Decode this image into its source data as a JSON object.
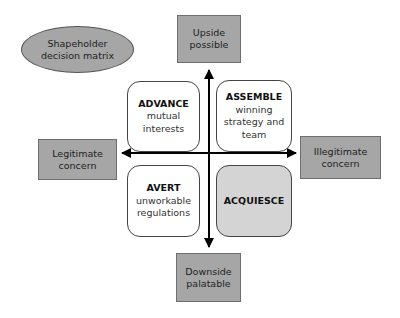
{
  "title_ellipse": {
    "lines": [
      "Shapeholder",
      "decision matrix"
    ]
  },
  "axes": {
    "top": {
      "lines": [
        "Upside",
        "possible"
      ]
    },
    "bottom": {
      "lines": [
        "Downside",
        "palatable"
      ]
    },
    "left": {
      "lines": [
        "Legitimate",
        "concern"
      ]
    },
    "right": {
      "lines": [
        "Illegitimate",
        "concern"
      ]
    }
  },
  "quadrants": [
    {
      "position": "top-left",
      "title": "ADVANCE",
      "lines": [
        "mutual",
        "interests"
      ],
      "shaded": false
    },
    {
      "position": "top-right",
      "title": "ASSEMBLE",
      "lines": [
        "winning",
        "strategy and",
        "team"
      ],
      "shaded": false
    },
    {
      "position": "bottom-left",
      "title": "AVERT",
      "lines": [
        "unworkable",
        "regulations"
      ],
      "shaded": false
    },
    {
      "position": "bottom-right",
      "title": "ACQUIESCE",
      "lines": [],
      "shaded": true
    }
  ],
  "colors": {
    "label_box_fill": "#a6a6a6",
    "shaded_quadrant_fill": "#d4d4d4",
    "axis_color": "#000000"
  }
}
